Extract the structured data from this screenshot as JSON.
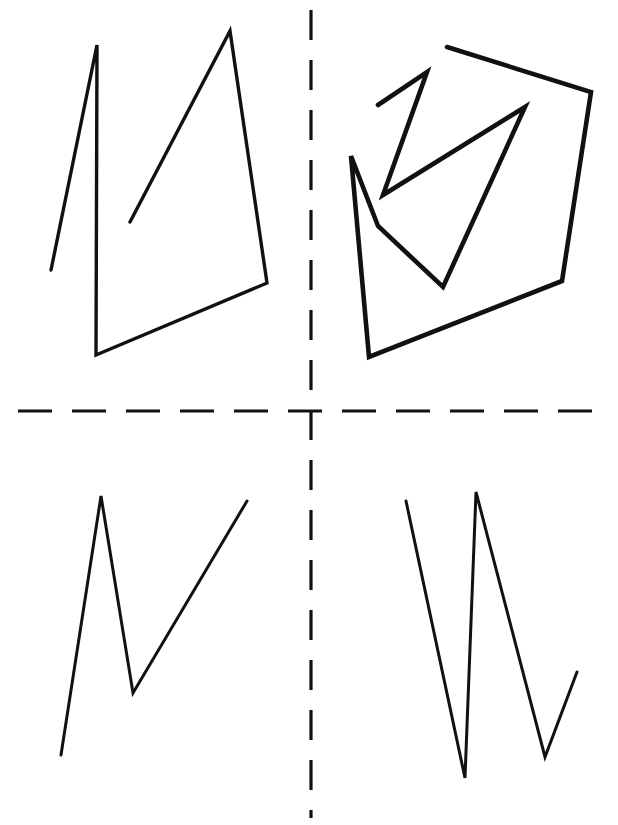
{
  "page": {
    "width": 618,
    "height": 825,
    "background_color": "#ffffff",
    "ink_color": "#111111"
  },
  "axes": {
    "horizontal": {
      "label": "horizontal-dashed-axis",
      "y": 411,
      "x_start": 18,
      "x_end": 600,
      "dash_pattern": "34 20",
      "stroke_width": 3.2,
      "color": "#111111"
    },
    "vertical": {
      "label": "vertical-dashed-axis",
      "x": 311,
      "y_start": 10,
      "y_end": 818,
      "dash_pattern": "30 20",
      "stroke_width": 3.2,
      "color": "#111111"
    }
  },
  "chart_data": {
    "type": "line",
    "xlabel": "",
    "ylabel": "",
    "xlim": [
      0,
      618
    ],
    "ylim": [
      825,
      0
    ],
    "grid": false,
    "legend": "none",
    "annotations": [
      "Dashed horizontal axis at y=411",
      "Dashed vertical axis at x=311"
    ],
    "series": [
      {
        "name": "top-left-figure",
        "quadrant": "top-left",
        "stroke_width": 3.4,
        "closed": false,
        "points": [
          [
            51,
            270
          ],
          [
            97,
            45
          ],
          [
            96,
            355
          ],
          [
            267,
            283
          ],
          [
            230,
            31
          ],
          [
            130,
            222
          ]
        ]
      },
      {
        "name": "top-right-outer-figure",
        "quadrant": "top-right",
        "stroke_width": 4.6,
        "closed": false,
        "points": [
          [
            447,
            47
          ],
          [
            591,
            92
          ],
          [
            562,
            281
          ],
          [
            369,
            357
          ],
          [
            351,
            156
          ],
          [
            378,
            226
          ],
          [
            443,
            287
          ],
          [
            525,
            107
          ],
          [
            383,
            195
          ],
          [
            427,
            72
          ],
          [
            378,
            105
          ]
        ]
      },
      {
        "name": "bottom-left-figure",
        "quadrant": "bottom-left",
        "stroke_width": 3.0,
        "closed": false,
        "points": [
          [
            61,
            755
          ],
          [
            101,
            496
          ],
          [
            133,
            693
          ],
          [
            247,
            501
          ]
        ]
      },
      {
        "name": "bottom-right-figure",
        "quadrant": "bottom-right",
        "stroke_width": 3.0,
        "closed": false,
        "points": [
          [
            406,
            501
          ],
          [
            465,
            778
          ],
          [
            476,
            492
          ],
          [
            545,
            757
          ],
          [
            577,
            672
          ]
        ]
      }
    ]
  }
}
